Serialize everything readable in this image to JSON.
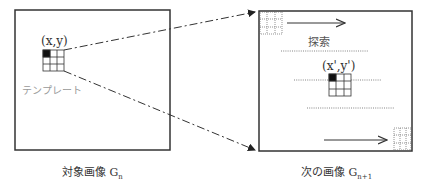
{
  "left_panel": {
    "coord_label": "(x,y)",
    "template_label": "テンプレート",
    "caption": "対象画像 G",
    "caption_sub": "n"
  },
  "right_panel": {
    "search_label": "探索",
    "coord_label": "(x',y')",
    "caption": "次の画像 G",
    "caption_sub": "n+1"
  },
  "colors": {
    "frame": "#333333",
    "template_label": "#999999",
    "dotted": "#666666"
  }
}
